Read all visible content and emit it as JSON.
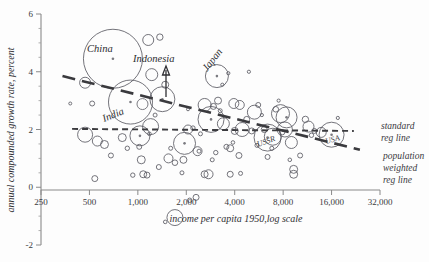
{
  "chart_data": {
    "type": "scatter",
    "title": "",
    "xlabel": "income per capita 1950, log scale",
    "ylabel": "annual compounded growth rate, percent",
    "xscale": "log",
    "xlim": [
      250,
      32000
    ],
    "ylim": [
      -2,
      6
    ],
    "xticks": [
      "250",
      "500",
      "1,000",
      "2,000",
      "4,000",
      "8,000",
      "16,000",
      "32,000"
    ],
    "xtick_values": [
      250,
      500,
      1000,
      2000,
      4000,
      8000,
      16000,
      32000
    ],
    "yticks": [
      "-2",
      "0",
      "2",
      "4",
      "6"
    ],
    "ytick_values": [
      -2,
      0,
      2,
      4,
      6
    ],
    "grid": false,
    "legend_position": "right",
    "series": [
      {
        "name": "countries",
        "encoding": "bubble size = population",
        "points": [
          {
            "label": "China",
            "x": 700,
            "y": 4.45,
            "r": 29.5
          },
          {
            "label": "India",
            "x": 900,
            "y": 2.95,
            "r": 22.0
          },
          {
            "label": "Indonesia",
            "x": 1420,
            "y": 3.05,
            "r": 12.5
          },
          {
            "label": "Japan",
            "x": 3100,
            "y": 3.85,
            "r": 11.5
          },
          {
            "label": "USSR",
            "x": 6400,
            "y": 1.72,
            "r": 13.5
          },
          {
            "label": "USA",
            "x": 16000,
            "y": 1.82,
            "r": 12.5
          },
          {
            "label": "",
            "x": 2850,
            "y": 2.35,
            "r": 13.0
          },
          {
            "label": "",
            "x": 1950,
            "y": 1.52,
            "r": 11.0
          },
          {
            "label": "",
            "x": 8400,
            "y": 2.42,
            "r": 10.5
          },
          {
            "label": "",
            "x": 7700,
            "y": 2.55,
            "r": 9.0
          },
          {
            "label": "",
            "x": 1030,
            "y": 1.78,
            "r": 10.0
          },
          {
            "label": "",
            "x": 470,
            "y": 1.82,
            "r": 7.5
          },
          {
            "label": "",
            "x": 1200,
            "y": 2.1,
            "r": 8.0
          },
          {
            "label": "",
            "x": 5300,
            "y": 2.6,
            "r": 7.0
          },
          {
            "label": "",
            "x": 1700,
            "y": -1.05,
            "r": 8.0
          },
          {
            "label": "",
            "x": 4450,
            "y": 2.0,
            "r": 7.0
          },
          {
            "label": "",
            "x": 2600,
            "y": 2.85,
            "r": 6.5
          },
          {
            "label": "",
            "x": 8200,
            "y": 2.0,
            "r": 7.5
          },
          {
            "label": "",
            "x": 470,
            "y": 3.62,
            "r": 5.5
          },
          {
            "label": "",
            "x": 1220,
            "y": 3.9,
            "r": 6.0
          },
          {
            "label": "",
            "x": 1160,
            "y": 5.1,
            "r": 5.5
          },
          {
            "label": "",
            "x": 1370,
            "y": 5.2,
            "r": 3.2
          },
          {
            "label": "",
            "x": 6900,
            "y": 1.75,
            "r": 8.5
          },
          {
            "label": "",
            "x": 3400,
            "y": 2.2,
            "r": 6.0
          },
          {
            "label": "",
            "x": 11500,
            "y": 2.1,
            "r": 5.5
          },
          {
            "label": "",
            "x": 13800,
            "y": 1.9,
            "r": 5.0
          },
          {
            "label": "",
            "x": 3950,
            "y": 2.9,
            "r": 5.0
          },
          {
            "label": "",
            "x": 4300,
            "y": 2.85,
            "r": 4.5
          },
          {
            "label": "",
            "x": 2050,
            "y": 2.0,
            "r": 4.5
          },
          {
            "label": "",
            "x": 1480,
            "y": 3.55,
            "r": 3.5
          },
          {
            "label": "",
            "x": 9000,
            "y": 1.55,
            "r": 6.0
          },
          {
            "label": "",
            "x": 2350,
            "y": 1.25,
            "r": 4.5
          },
          {
            "label": "",
            "x": 1050,
            "y": 0.95,
            "r": 4.0
          },
          {
            "label": "",
            "x": 1550,
            "y": 1.0,
            "r": 4.5
          },
          {
            "label": "",
            "x": 1920,
            "y": 0.95,
            "r": 3.5
          },
          {
            "label": "",
            "x": 560,
            "y": 1.6,
            "r": 5.0
          },
          {
            "label": "",
            "x": 620,
            "y": 1.48,
            "r": 4.0
          },
          {
            "label": "",
            "x": 800,
            "y": 1.72,
            "r": 4.0
          },
          {
            "label": "",
            "x": 2750,
            "y": 0.45,
            "r": 4.5
          },
          {
            "label": "",
            "x": 3750,
            "y": 1.35,
            "r": 3.5
          },
          {
            "label": "",
            "x": 4250,
            "y": 1.1,
            "r": 3.0
          },
          {
            "label": "",
            "x": 9300,
            "y": 0.62,
            "r": 4.0
          },
          {
            "label": "",
            "x": 9300,
            "y": 0.45,
            "r": 4.0
          },
          {
            "label": "",
            "x": 2300,
            "y": -0.35,
            "r": 3.0
          },
          {
            "label": "",
            "x": 540,
            "y": 0.3,
            "r": 3.0
          },
          {
            "label": "",
            "x": 1080,
            "y": 0.45,
            "r": 3.5
          },
          {
            "label": "",
            "x": 1140,
            "y": 0.42,
            "r": 3.0
          },
          {
            "label": "",
            "x": 2600,
            "y": 0.45,
            "r": 3.5
          },
          {
            "label": "",
            "x": 3750,
            "y": 0.45,
            "r": 3.0
          },
          {
            "label": "",
            "x": 520,
            "y": 2.9,
            "r": 2.5
          },
          {
            "label": "",
            "x": 2950,
            "y": 2.8,
            "r": 3.0
          },
          {
            "label": "",
            "x": 3150,
            "y": 3.0,
            "r": 3.5
          },
          {
            "label": "",
            "x": 5600,
            "y": 2.85,
            "r": 2.5
          },
          {
            "label": "",
            "x": 7200,
            "y": 2.7,
            "r": 2.8
          },
          {
            "label": "",
            "x": 4750,
            "y": 2.35,
            "r": 3.0
          },
          {
            "label": "",
            "x": 6100,
            "y": 2.0,
            "r": 3.0
          },
          {
            "label": "",
            "x": 11000,
            "y": 2.35,
            "r": 3.2
          },
          {
            "label": "",
            "x": 12500,
            "y": 1.95,
            "r": 2.5
          },
          {
            "label": "",
            "x": 5100,
            "y": 1.95,
            "r": 3.0
          },
          {
            "label": "",
            "x": 4000,
            "y": 1.95,
            "r": 3.5
          },
          {
            "label": "",
            "x": 1350,
            "y": 0.7,
            "r": 2.5
          },
          {
            "label": "",
            "x": 1700,
            "y": 0.85,
            "r": 2.8
          },
          {
            "label": "",
            "x": 1020,
            "y": 1.4,
            "r": 2.5
          },
          {
            "label": "",
            "x": 680,
            "y": 1.1,
            "r": 2.5
          },
          {
            "label": "",
            "x": 860,
            "y": 1.35,
            "r": 2.2
          },
          {
            "label": "",
            "x": 3550,
            "y": 1.4,
            "r": 2.5
          },
          {
            "label": "",
            "x": 3050,
            "y": 1.2,
            "r": 2.2
          },
          {
            "label": "",
            "x": 2400,
            "y": 1.25,
            "r": 2.0
          },
          {
            "label": "",
            "x": 6400,
            "y": 1.05,
            "r": 2.5
          },
          {
            "label": "",
            "x": 10200,
            "y": 1.1,
            "r": 2.5
          },
          {
            "label": "",
            "x": 2100,
            "y": -0.45,
            "r": 2.2
          },
          {
            "label": "",
            "x": 1480,
            "y": -1.2,
            "r": 1.8
          },
          {
            "label": "",
            "x": 3650,
            "y": 3.95,
            "r": 1.6
          },
          {
            "label": "",
            "x": 4900,
            "y": 4.0,
            "r": 1.6
          },
          {
            "label": "",
            "x": 3350,
            "y": 3.55,
            "r": 1.6
          },
          {
            "label": "",
            "x": 7500,
            "y": 3.0,
            "r": 1.6
          },
          {
            "label": "",
            "x": 5900,
            "y": 2.5,
            "r": 1.6
          },
          {
            "label": "",
            "x": 17500,
            "y": 2.4,
            "r": 1.6
          },
          {
            "label": "",
            "x": 380,
            "y": 2.9,
            "r": 1.5
          },
          {
            "label": "",
            "x": 2050,
            "y": 2.7,
            "r": 1.5
          },
          {
            "label": "",
            "x": 3900,
            "y": 1.55,
            "r": 1.8
          },
          {
            "label": "",
            "x": 8800,
            "y": 0.95,
            "r": 1.8
          },
          {
            "label": "",
            "x": 1180,
            "y": 1.85,
            "r": 1.8
          },
          {
            "label": "",
            "x": 2450,
            "y": 1.85,
            "r": 2.0
          },
          {
            "label": "",
            "x": 6800,
            "y": 1.35,
            "r": 2.0
          },
          {
            "label": "",
            "x": 1600,
            "y": 1.35,
            "r": 2.0
          },
          {
            "label": "",
            "x": 2900,
            "y": 0.95,
            "r": 2.0
          },
          {
            "label": "",
            "x": 1880,
            "y": 0.5,
            "r": 2.0
          },
          {
            "label": "",
            "x": 4350,
            "y": 0.48,
            "r": 2.0
          },
          {
            "label": "",
            "x": 930,
            "y": 0.42,
            "r": 2.2
          },
          {
            "label": "",
            "x": 5500,
            "y": 1.45,
            "r": 2.0
          },
          {
            "label": "",
            "x": 2200,
            "y": 2.05,
            "r": 2.2
          },
          {
            "label": "",
            "x": 3250,
            "y": 2.65,
            "r": 2.0
          },
          {
            "label": "",
            "x": 1280,
            "y": 2.5,
            "r": 2.0
          },
          {
            "label": "",
            "x": 7900,
            "y": 1.9,
            "r": 2.5
          },
          {
            "label": "",
            "x": 12000,
            "y": 1.8,
            "r": 2.2
          }
        ]
      }
    ],
    "annotations": [
      {
        "name": "China",
        "text": "China"
      },
      {
        "name": "India",
        "text": "India"
      },
      {
        "name": "Indonesia",
        "text": "Indonesia",
        "has_arrow": true
      },
      {
        "name": "Japan",
        "text": "Japan",
        "rotated": true
      },
      {
        "name": "USSR",
        "text": "USSR"
      },
      {
        "name": "USA",
        "text": "USA"
      }
    ],
    "trendlines": [
      {
        "name": "standard reg line",
        "style": "dashed-short",
        "x0": 390,
        "y0": 2.02,
        "x1": 22000,
        "y1": 1.95
      },
      {
        "name": "population weighted reg line",
        "style": "dashed-long",
        "x0": 340,
        "y0": 3.85,
        "x1": 24000,
        "y1": 1.3
      }
    ]
  },
  "legend": {
    "standard_line_1": "standard",
    "standard_line_2": "reg line",
    "weighted_line_1": "population",
    "weighted_line_2": "weighted",
    "weighted_line_3": "reg line"
  },
  "axes": {
    "x_title": "income per capita 1950,log scale",
    "y_title": "annual compounded growth rate, percent"
  }
}
